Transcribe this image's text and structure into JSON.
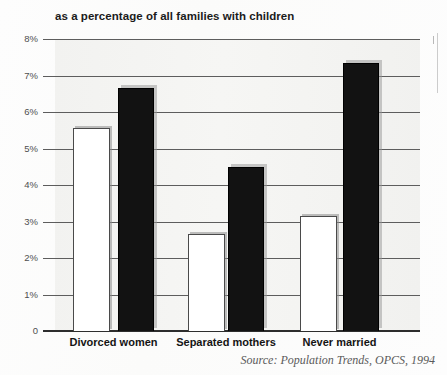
{
  "chart_data": {
    "type": "bar",
    "title": "as a percentage of all families with children",
    "xlabel": "",
    "ylabel": "",
    "ylim": [
      0,
      8
    ],
    "ytick_labels": [
      "8%",
      "7%",
      "6%",
      "5%",
      "4%",
      "3%",
      "2%",
      "1%",
      "0"
    ],
    "ytick_values": [
      8,
      7,
      6,
      5,
      4,
      3,
      2,
      1,
      0
    ],
    "grid": true,
    "legend": "none",
    "categories": [
      "Divorced women",
      "Separated mothers",
      "Never married"
    ],
    "series": [
      {
        "name": "white-bar",
        "color": "#ffffff",
        "values": [
          5.55,
          2.65,
          3.15
        ]
      },
      {
        "name": "black-bar",
        "color": "#121212",
        "values": [
          6.65,
          4.5,
          7.35
        ]
      }
    ],
    "source": "Source: Population Trends, OPCS, 1994"
  },
  "axis": {
    "ticks": [
      {
        "label": "8%",
        "value": 8
      },
      {
        "label": "7%",
        "value": 7
      },
      {
        "label": "6%",
        "value": 6
      },
      {
        "label": "5%",
        "value": 5
      },
      {
        "label": "4%",
        "value": 4
      },
      {
        "label": "3%",
        "value": 3
      },
      {
        "label": "2%",
        "value": 2
      },
      {
        "label": "1%",
        "value": 1
      },
      {
        "label": "0",
        "value": 0
      }
    ]
  },
  "categories": [
    {
      "label": "Divorced women"
    },
    {
      "label": "Separated mothers"
    },
    {
      "label": "Never married"
    }
  ],
  "footer": {
    "source": "Source: Population Trends, OPCS, 1994"
  }
}
